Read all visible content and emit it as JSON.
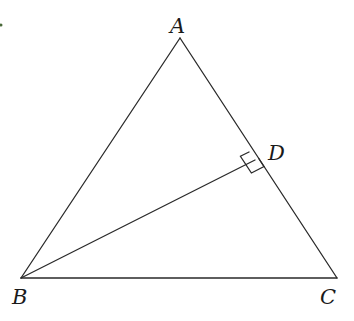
{
  "diagram": {
    "type": "geometry-triangle",
    "points": {
      "A": {
        "label": "A",
        "x": 180,
        "y": 38
      },
      "B": {
        "label": "B",
        "x": 21,
        "y": 278
      },
      "C": {
        "label": "C",
        "x": 337,
        "y": 278
      },
      "D": {
        "label": "D",
        "x": 255,
        "y": 160
      }
    },
    "segments": [
      "AB",
      "AC",
      "BC",
      "BD"
    ],
    "right_angle_at": "D",
    "annotations": [
      "BD ⊥ AC"
    ],
    "colors": {
      "line": "#2a2a2a",
      "text": "#1a1a1a",
      "background": "#ffffff",
      "artifact": "#4a6a3a"
    }
  }
}
